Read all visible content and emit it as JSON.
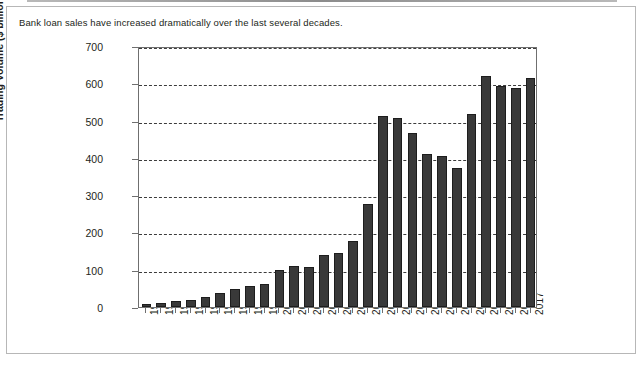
{
  "caption": "Bank loan sales have increased dramatically over the last several decades.",
  "chart_data": {
    "type": "bar",
    "title": "",
    "xlabel": "",
    "ylabel": "Trading Volume ($ billions)",
    "ylim": [
      0,
      700
    ],
    "yticks": [
      0,
      100,
      200,
      300,
      400,
      500,
      600,
      700
    ],
    "grid": true,
    "legend": "none",
    "bar_color": "#393939",
    "categories": [
      "1991",
      "1992",
      "1993",
      "1994",
      "1995",
      "1996",
      "1997",
      "1998",
      "1999",
      "2000",
      "2001",
      "2002",
      "2003",
      "2004",
      "2005",
      "2006",
      "2007",
      "2008",
      "2009",
      "2010",
      "2011",
      "2012",
      "2013",
      "2014",
      "2015",
      "2016",
      "2017"
    ],
    "values": [
      8,
      10,
      15,
      20,
      27,
      38,
      47,
      56,
      62,
      100,
      110,
      108,
      140,
      146,
      176,
      275,
      512,
      507,
      466,
      410,
      405,
      372,
      518,
      620,
      594,
      587,
      615
    ]
  }
}
